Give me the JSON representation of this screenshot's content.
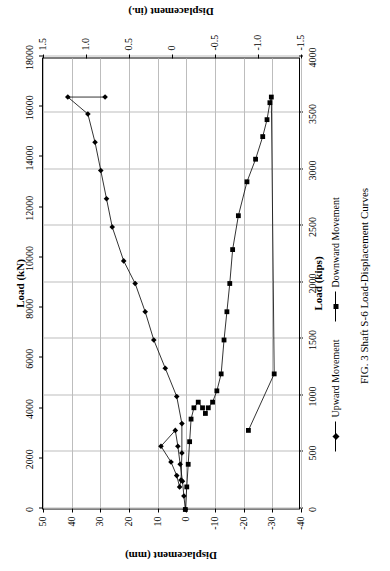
{
  "figure": {
    "caption": "FIG. 3 Shaft S-6 Load-Displacement Curves",
    "legend": [
      {
        "label": "Upward Movement",
        "marker": "diamond",
        "color": "#000000"
      },
      {
        "label": "Downward Movement",
        "marker": "square",
        "color": "#000000"
      }
    ]
  },
  "chart_data": {
    "type": "line",
    "title": "",
    "xlabel": "Load (kips)",
    "xlabel_secondary": "Load (kN)",
    "ylabel": "Displacement (mm)",
    "ylabel_secondary": "Displacement (in.)",
    "xlim": [
      0,
      4000
    ],
    "xticks": [
      0,
      500,
      1000,
      1500,
      2000,
      2500,
      3000,
      3500,
      4000
    ],
    "xlim_secondary": [
      0,
      18000
    ],
    "xticks_secondary": [
      0,
      2000,
      4000,
      6000,
      8000,
      10000,
      12000,
      14000,
      16000,
      18000
    ],
    "ylim": [
      -40,
      50
    ],
    "yticks": [
      50,
      40,
      30,
      20,
      10,
      0,
      -10,
      -20,
      -30,
      -40
    ],
    "ylim_secondary": [
      -1.5,
      1.5
    ],
    "yticks_secondary": [
      1.5,
      1.0,
      0.5,
      0,
      -0.5,
      -1.0,
      -1.5
    ],
    "grid": true,
    "legend_position": "below",
    "series": [
      {
        "name": "Upward Movement",
        "marker": "diamond",
        "points": [
          [
            0,
            0
          ],
          [
            120,
            0.5
          ],
          [
            250,
            1.0
          ],
          [
            400,
            1.8
          ],
          [
            560,
            2.6
          ],
          [
            700,
            3.5
          ],
          [
            560,
            8.5
          ],
          [
            420,
            5.0
          ],
          [
            300,
            3.0
          ],
          [
            200,
            2.0
          ],
          [
            260,
            1.5
          ],
          [
            500,
            1.2
          ],
          [
            760,
            1.2
          ],
          [
            1000,
            3.0
          ],
          [
            1250,
            7.0
          ],
          [
            1500,
            11.0
          ],
          [
            1750,
            14.0
          ],
          [
            2000,
            17.5
          ],
          [
            2200,
            21.5
          ],
          [
            2500,
            25.5
          ],
          [
            2750,
            27.5
          ],
          [
            3000,
            29.5
          ],
          [
            3250,
            31.5
          ],
          [
            3500,
            34.0
          ],
          [
            3650,
            41.0
          ],
          [
            3650,
            28.0
          ]
        ]
      },
      {
        "name": "Downward Movement",
        "marker": "square",
        "points": [
          [
            0,
            0
          ],
          [
            200,
            -0.5
          ],
          [
            400,
            -1.0
          ],
          [
            600,
            -1.5
          ],
          [
            800,
            -2.0
          ],
          [
            900,
            -3.0
          ],
          [
            950,
            -4.5
          ],
          [
            900,
            -6.0
          ],
          [
            850,
            -7.0
          ],
          [
            900,
            -8.0
          ],
          [
            950,
            -9.5
          ],
          [
            1050,
            -11.0
          ],
          [
            1200,
            -12.5
          ],
          [
            1500,
            -13.5
          ],
          [
            1750,
            -14.5
          ],
          [
            2000,
            -15.5
          ],
          [
            2300,
            -16.5
          ],
          [
            2600,
            -18.5
          ],
          [
            2900,
            -21.5
          ],
          [
            3100,
            -24.5
          ],
          [
            3300,
            -27.0
          ],
          [
            3450,
            -28.5
          ],
          [
            3600,
            -29.5
          ],
          [
            3650,
            -30.0
          ],
          [
            1200,
            -31.0
          ],
          [
            700,
            -22.0
          ]
        ]
      }
    ]
  }
}
